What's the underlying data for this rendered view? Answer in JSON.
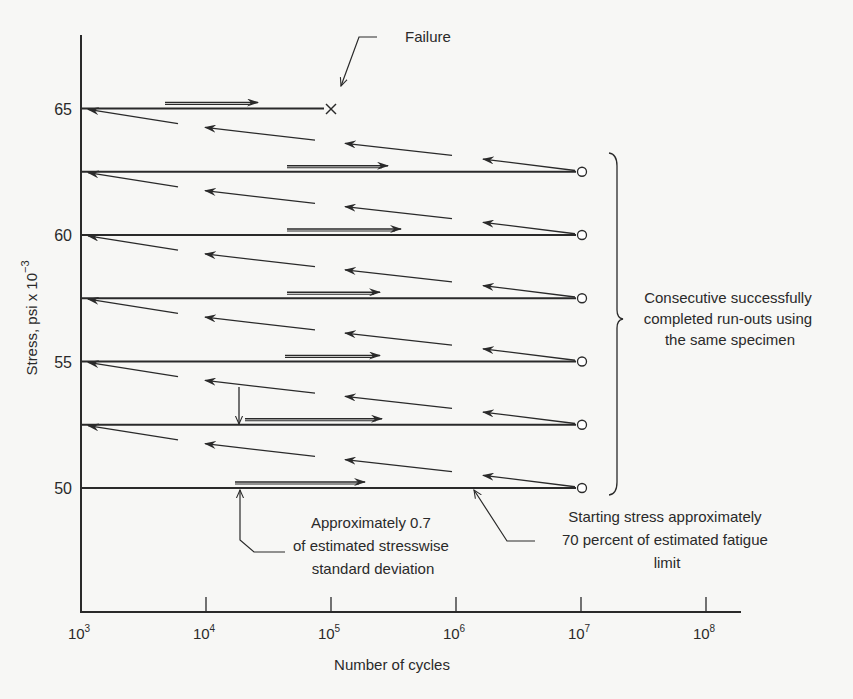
{
  "chart_data": {
    "type": "line",
    "title": "",
    "xlabel": "Number of cycles",
    "ylabel": "Stress, psi x 10^-3",
    "x_scale": "log",
    "xlim": [
      1000,
      200000000
    ],
    "ylim": [
      45,
      67
    ],
    "x_ticks": [
      {
        "value": 1000,
        "base": "10",
        "exp": "3"
      },
      {
        "value": 10000,
        "base": "10",
        "exp": "4"
      },
      {
        "value": 100000,
        "base": "10",
        "exp": "5"
      },
      {
        "value": 1000000,
        "base": "10",
        "exp": "6"
      },
      {
        "value": 10000000,
        "base": "10",
        "exp": "7"
      },
      {
        "value": 100000000,
        "base": "10",
        "exp": "8"
      }
    ],
    "y_ticks": [
      {
        "value": 50,
        "label": "50"
      },
      {
        "value": 55,
        "label": "55"
      },
      {
        "value": 60,
        "label": "60"
      },
      {
        "value": 65,
        "label": "65"
      }
    ],
    "grid": false,
    "series": [
      {
        "name": "Run-out (step 1)",
        "stress": 50.0,
        "cycles_end": 10000000,
        "result": "run-out"
      },
      {
        "name": "Run-out (step 2)",
        "stress": 52.5,
        "cycles_end": 10000000,
        "result": "run-out"
      },
      {
        "name": "Run-out (step 3)",
        "stress": 55.0,
        "cycles_end": 10000000,
        "result": "run-out"
      },
      {
        "name": "Run-out (step 4)",
        "stress": 57.5,
        "cycles_end": 10000000,
        "result": "run-out"
      },
      {
        "name": "Run-out (step 5)",
        "stress": 60.0,
        "cycles_end": 10000000,
        "result": "run-out"
      },
      {
        "name": "Run-out (step 6)",
        "stress": 62.5,
        "cycles_end": 10000000,
        "result": "run-out"
      },
      {
        "name": "Failure",
        "stress": 65.0,
        "cycles_end": 100000,
        "result": "failure"
      }
    ],
    "markers": {
      "run_out": "open circle",
      "failure": "x"
    },
    "annotations": [
      {
        "id": "failure",
        "text": "Failure"
      },
      {
        "id": "runouts",
        "lines": [
          "Consecutive successfully",
          "completed run-outs using",
          "the same specimen"
        ]
      },
      {
        "id": "step",
        "lines": [
          "Approximately 0.7",
          "of estimated stresswise",
          "standard deviation"
        ]
      },
      {
        "id": "start",
        "lines": [
          "Starting stress approximately",
          "70 percent of estimated fatigue",
          "limit"
        ]
      }
    ]
  },
  "colors": {
    "ink": "#2a2a2a",
    "background": "#f7f7f5"
  }
}
